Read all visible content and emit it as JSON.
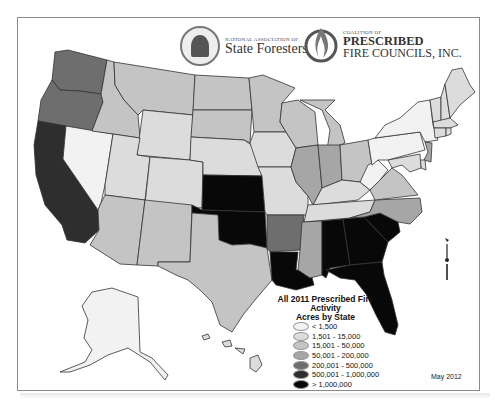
{
  "header": {
    "logo_left": {
      "org_line1": "NATIONAL ASSOCIATION OF",
      "org_line2": "State Foresters",
      "icon": "tree-seal-icon"
    },
    "logo_right": {
      "org_line1": "COALITION OF",
      "org_line2": "PRESCRIBED",
      "org_line3": "FIRE COUNCILS, INC.",
      "icon": "flame-icon"
    }
  },
  "legend": {
    "title_line1": "All 2011 Prescribed Fire Activity",
    "title_line2": "Acres by State",
    "classes": [
      {
        "label": "< 1,500",
        "color": "#f2f2f2"
      },
      {
        "label": "1,501 - 15,000",
        "color": "#dcdcdc"
      },
      {
        "label": "15,001 - 50,000",
        "color": "#c4c4c4"
      },
      {
        "label": "50,001 - 200,000",
        "color": "#a6a6a6"
      },
      {
        "label": "200,001 - 500,000",
        "color": "#6e6e6e"
      },
      {
        "label": "500,001 - 1,000,000",
        "color": "#2e2e2e"
      },
      {
        "label": "> 1,000,000",
        "color": "#080808"
      }
    ]
  },
  "date_label": "May 2012",
  "map": {
    "states": {
      "WA": 4,
      "OR": 4,
      "CA": 5,
      "NV": 0,
      "ID": 2,
      "MT": 2,
      "WY": 1,
      "UT": 1,
      "AZ": 2,
      "CO": 1,
      "NM": 2,
      "ND": 2,
      "SD": 2,
      "NE": 1,
      "KS": 6,
      "OK": 6,
      "TX": 2,
      "MN": 2,
      "IA": 1,
      "MO": 1,
      "AR": 4,
      "LA": 6,
      "WI": 2,
      "IL": 3,
      "MI": 2,
      "IN": 3,
      "OH": 2,
      "KY": 1,
      "TN": 1,
      "MS": 3,
      "AL": 6,
      "GA": 6,
      "FL": 6,
      "SC": 6,
      "NC": 3,
      "VA": 2,
      "WV": 0,
      "PA": 0,
      "NY": 0,
      "VT": 1,
      "NH": 1,
      "ME": 1,
      "MA": 1,
      "CT": 1,
      "RI": 1,
      "NJ": 3,
      "DE": 1,
      "MD": 1,
      "AK": 0,
      "HI": 1
    }
  }
}
